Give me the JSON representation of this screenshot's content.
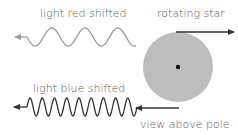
{
  "diagram": {
    "labels": {
      "red_wave": "light red shifted",
      "star": "rotating star",
      "blue_wave": "light blue shifted",
      "view": "view above pole"
    },
    "colors": {
      "background": "#ffffff",
      "star_fill": "#bdbdbd",
      "star_center": "#111111",
      "red_wave_stroke": "#9a9a9a",
      "blue_wave_stroke": "#333333",
      "arrow_stroke": "#333333",
      "text": "#555555"
    },
    "star": {
      "cx": 178,
      "cy": 67,
      "r": 35
    },
    "red_wave": {
      "x_start": 27,
      "x_end": 136,
      "y_center": 37,
      "amplitude": 9,
      "periods": 3.3
    },
    "blue_wave": {
      "x_start": 27,
      "x_end": 137,
      "y_center": 107,
      "amplitude": 9,
      "periods": 9
    }
  }
}
